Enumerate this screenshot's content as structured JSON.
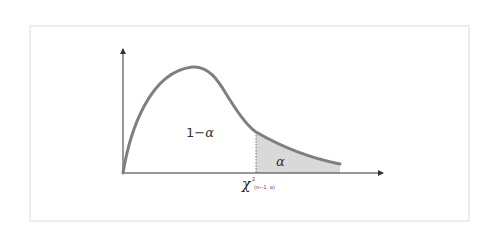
{
  "diagram": {
    "labels": {
      "acceptance_region_prefix": "1−",
      "acceptance_region_symbol": "α",
      "rejection_region": "α",
      "critical_value_symbol": "χ",
      "critical_value_superscript": "2",
      "critical_value_subscript": "(n−1, α)"
    },
    "colors": {
      "curve": "#7f7f7f",
      "shaded_region": "#d9d9d9",
      "axes": "#333333",
      "frame": "#eeeeee"
    }
  }
}
